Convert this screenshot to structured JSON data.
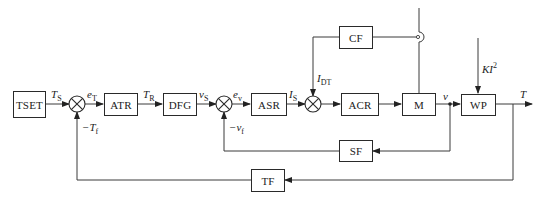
{
  "diagram": {
    "type": "control-loop block diagram",
    "blocks": {
      "tset": "TSET",
      "atr": "ATR",
      "dfg": "DFG",
      "asr": "ASR",
      "acr": "ACR",
      "m": "M",
      "wp": "WP",
      "cf": "CF",
      "sf": "SF",
      "tf": "TF"
    },
    "signals": {
      "ts": {
        "main": "T",
        "sub": "S"
      },
      "et": {
        "main": "e",
        "sub": "T"
      },
      "tr": {
        "main": "T",
        "sub": "R"
      },
      "vs": {
        "main": "v",
        "sub": "S"
      },
      "ev": {
        "main": "e",
        "sub": "v"
      },
      "is": {
        "main": "I",
        "sub": "S"
      },
      "idt": {
        "main": "I",
        "sub": "DT"
      },
      "v": {
        "main": "v"
      },
      "t": {
        "main": "T"
      },
      "tf_neg": {
        "main": "−T",
        "sub": "f"
      },
      "vf_neg": {
        "main": "−v",
        "sub": "f"
      },
      "ki2": {
        "main": "KI",
        "sup": "2"
      }
    },
    "colors": {
      "line": "#3a3a3a",
      "box_border": "#2a2a2a",
      "background": "#ffffff"
    }
  }
}
